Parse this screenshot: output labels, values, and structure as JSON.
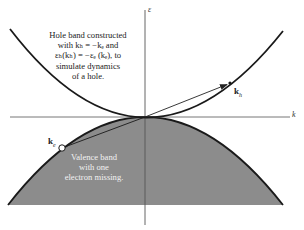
{
  "figure": {
    "axes": {
      "y_label": "ε",
      "x_label": "k"
    },
    "hole_band_annotation": {
      "lines": [
        "Hole band constructed",
        "with kₕ = −kₑ and",
        "εₕ(kₕ) = −εₑ (kₑ), to",
        "simulate dynamics",
        "of a hole."
      ]
    },
    "valence_band_annotation": {
      "lines": [
        "Valence band",
        "with one",
        "electron missing."
      ]
    },
    "points": {
      "electron": {
        "label": "k",
        "subscript": "e"
      },
      "hole": {
        "label": "k",
        "subscript": "h"
      }
    },
    "colors": {
      "valence_fill": "#8a8a8a",
      "curve": "#1a1a1a",
      "axis": "#555555",
      "background": "#ffffff"
    }
  }
}
